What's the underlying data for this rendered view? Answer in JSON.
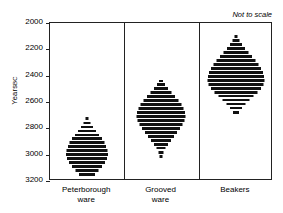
{
  "chart_data": {
    "type": "bar",
    "title": "",
    "subtitle": "",
    "annotation": "Not to scale",
    "xlabel": "",
    "ylabel": "Years",
    "ylabel_suffix": "BC",
    "ylim": [
      2000,
      3200
    ],
    "y_inverted": true,
    "yticks": [
      2000,
      2200,
      2400,
      2600,
      2800,
      3000,
      3200
    ],
    "ytick_labels": [
      "2000",
      "2200",
      "2400",
      "2600",
      "2800",
      "3000",
      "3200"
    ],
    "grid": false,
    "legend": "none",
    "categories": [
      "Peterborough ware",
      "Grooved ware",
      "Beakers"
    ],
    "category_labels": [
      "Peterborough\nware",
      "Grooved\nware",
      "Beakers"
    ],
    "series": [
      {
        "name": "Peterborough ware",
        "bars": [
          {
            "year": 2725,
            "width": 3
          },
          {
            "year": 2760,
            "width": 7
          },
          {
            "year": 2790,
            "width": 12
          },
          {
            "year": 2820,
            "width": 18
          },
          {
            "year": 2850,
            "width": 24
          },
          {
            "year": 2880,
            "width": 30
          },
          {
            "year": 2910,
            "width": 35
          },
          {
            "year": 2940,
            "width": 38
          },
          {
            "year": 2970,
            "width": 41
          },
          {
            "year": 3000,
            "width": 42
          },
          {
            "year": 3030,
            "width": 40
          },
          {
            "year": 3060,
            "width": 36
          },
          {
            "year": 3090,
            "width": 30
          },
          {
            "year": 3120,
            "width": 23
          },
          {
            "year": 3150,
            "width": 16
          }
        ]
      },
      {
        "name": "Grooved ware",
        "bars": [
          {
            "year": 2440,
            "width": 4
          },
          {
            "year": 2470,
            "width": 8
          },
          {
            "year": 2500,
            "width": 14
          },
          {
            "year": 2530,
            "width": 21
          },
          {
            "year": 2560,
            "width": 28
          },
          {
            "year": 2590,
            "width": 35
          },
          {
            "year": 2620,
            "width": 41
          },
          {
            "year": 2650,
            "width": 45
          },
          {
            "year": 2680,
            "width": 48
          },
          {
            "year": 2710,
            "width": 49
          },
          {
            "year": 2740,
            "width": 47
          },
          {
            "year": 2770,
            "width": 43
          },
          {
            "year": 2800,
            "width": 38
          },
          {
            "year": 2830,
            "width": 32
          },
          {
            "year": 2860,
            "width": 26
          },
          {
            "year": 2890,
            "width": 20
          },
          {
            "year": 2920,
            "width": 14
          },
          {
            "year": 2950,
            "width": 9
          },
          {
            "year": 2985,
            "width": 5
          },
          {
            "year": 3015,
            "width": 3
          }
        ]
      },
      {
        "name": "Beakers",
        "bars": [
          {
            "year": 2105,
            "width": 3
          },
          {
            "year": 2135,
            "width": 7
          },
          {
            "year": 2165,
            "width": 12
          },
          {
            "year": 2195,
            "width": 18
          },
          {
            "year": 2225,
            "width": 25
          },
          {
            "year": 2255,
            "width": 32
          },
          {
            "year": 2285,
            "width": 39
          },
          {
            "year": 2315,
            "width": 45
          },
          {
            "year": 2345,
            "width": 50
          },
          {
            "year": 2375,
            "width": 54
          },
          {
            "year": 2405,
            "width": 56
          },
          {
            "year": 2435,
            "width": 57
          },
          {
            "year": 2465,
            "width": 55
          },
          {
            "year": 2495,
            "width": 50
          },
          {
            "year": 2525,
            "width": 43
          },
          {
            "year": 2555,
            "width": 35
          },
          {
            "year": 2585,
            "width": 27
          },
          {
            "year": 2615,
            "width": 19
          },
          {
            "year": 2645,
            "width": 12
          },
          {
            "year": 2680,
            "width": 6
          }
        ]
      }
    ]
  }
}
